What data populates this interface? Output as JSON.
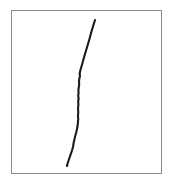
{
  "figure": {
    "width": 173,
    "height": 184,
    "background_color": "#ffffff"
  },
  "frame": {
    "name": "rectangular border",
    "x": 11,
    "y": 10,
    "width": 151,
    "height": 164,
    "stroke_color": "#8c8c8c",
    "stroke_width": 1,
    "fill_color": "#ffffff"
  },
  "chart_data": {
    "type": "line",
    "title": "",
    "xlabel": "",
    "ylabel": "",
    "xlim": [
      11,
      162
    ],
    "ylim": [
      10,
      174
    ],
    "grid": false,
    "legend": null,
    "series": [
      {
        "name": "hand-drawn stroke",
        "stroke_color": "#1a1a1a",
        "stroke_width": 2.1,
        "points": [
          [
            95.0,
            20.0
          ],
          [
            93.6,
            24.5
          ],
          [
            92.2,
            29.0
          ],
          [
            90.8,
            34.0
          ],
          [
            89.6,
            38.5
          ],
          [
            88.6,
            42.0
          ],
          [
            87.4,
            46.0
          ],
          [
            86.2,
            50.0
          ],
          [
            85.0,
            54.0
          ],
          [
            84.0,
            57.5
          ],
          [
            83.0,
            61.0
          ],
          [
            82.2,
            64.0
          ],
          [
            81.4,
            66.8
          ],
          [
            80.6,
            69.5
          ],
          [
            80.0,
            72.0
          ],
          [
            79.6,
            74.0
          ],
          [
            80.0,
            75.6
          ],
          [
            79.6,
            77.5
          ],
          [
            79.2,
            79.5
          ],
          [
            79.0,
            82.0
          ],
          [
            79.2,
            84.5
          ],
          [
            78.8,
            87.0
          ],
          [
            78.4,
            90.0
          ],
          [
            78.6,
            93.0
          ],
          [
            78.2,
            95.5
          ],
          [
            78.6,
            98.5
          ],
          [
            78.2,
            101.5
          ],
          [
            78.4,
            105.0
          ],
          [
            78.0,
            108.5
          ],
          [
            78.3,
            112.0
          ],
          [
            78.0,
            115.5
          ],
          [
            78.2,
            119.0
          ],
          [
            78.0,
            122.0
          ],
          [
            77.6,
            125.5
          ],
          [
            77.0,
            129.0
          ],
          [
            76.2,
            132.5
          ],
          [
            75.2,
            136.0
          ],
          [
            74.4,
            139.5
          ],
          [
            73.6,
            143.0
          ],
          [
            73.0,
            147.0
          ],
          [
            72.0,
            150.5
          ],
          [
            70.8,
            154.0
          ],
          [
            69.6,
            157.5
          ],
          [
            68.4,
            161.0
          ],
          [
            67.4,
            164.0
          ],
          [
            67.0,
            166.0
          ]
        ]
      }
    ]
  }
}
